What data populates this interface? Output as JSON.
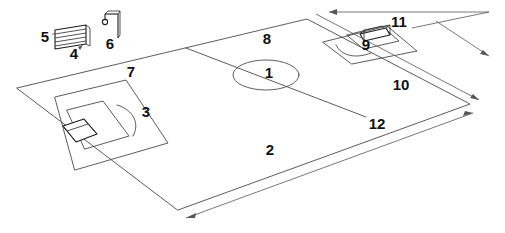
{
  "diagram": {
    "type": "technical-line-drawing",
    "background_color": "#ffffff",
    "line_color": "#4a4a4a",
    "label_color": "#111111",
    "callouts": [
      {
        "id": "1",
        "text": "1",
        "x": 269,
        "y": 74,
        "refers_to": "centre-circle"
      },
      {
        "id": "2",
        "text": "2",
        "x": 270,
        "y": 151,
        "refers_to": "near-touchline"
      },
      {
        "id": "3",
        "text": "3",
        "x": 146,
        "y": 113,
        "refers_to": "left-penalty-arc"
      },
      {
        "id": "4",
        "text": "4",
        "x": 74,
        "y": 55,
        "refers_to": "bench-seating"
      },
      {
        "id": "5",
        "text": "5",
        "x": 45,
        "y": 38,
        "refers_to": "bench-leader-line"
      },
      {
        "id": "6",
        "text": "6",
        "x": 110,
        "y": 45,
        "refers_to": "corner-flag-pole"
      },
      {
        "id": "7",
        "text": "7",
        "x": 131,
        "y": 73,
        "refers_to": "far-touchline"
      },
      {
        "id": "8",
        "text": "8",
        "x": 267,
        "y": 40,
        "refers_to": "far-half-surface"
      },
      {
        "id": "9",
        "text": "9",
        "x": 366,
        "y": 46,
        "refers_to": "right-penalty-arc"
      },
      {
        "id": "10",
        "text": "10",
        "x": 401,
        "y": 86,
        "refers_to": "right-goal-line"
      },
      {
        "id": "11",
        "text": "11",
        "x": 399,
        "y": 23,
        "refers_to": "right-goal"
      },
      {
        "id": "12",
        "text": "12",
        "x": 377,
        "y": 125,
        "refers_to": "halfway-line"
      }
    ],
    "objects": [
      {
        "name": "pitch-outline",
        "label": null
      },
      {
        "name": "halfway-line",
        "label": "12"
      },
      {
        "name": "centre-circle",
        "label": "1"
      },
      {
        "name": "left-penalty-area",
        "label": null
      },
      {
        "name": "left-goal-area",
        "label": null
      },
      {
        "name": "left-penalty-arc",
        "label": "3"
      },
      {
        "name": "left-goal",
        "label": null
      },
      {
        "name": "right-penalty-area",
        "label": null
      },
      {
        "name": "right-goal-area",
        "label": null
      },
      {
        "name": "right-penalty-arc",
        "label": "9"
      },
      {
        "name": "right-goal",
        "label": "11"
      },
      {
        "name": "team-bench",
        "label": "4"
      },
      {
        "name": "corner-flag-pole",
        "label": "6"
      },
      {
        "name": "dimension-near-touchline",
        "label": "2"
      },
      {
        "name": "dimension-right-goal-line",
        "label": "10"
      },
      {
        "name": "dimension-top-edge",
        "label": "11"
      }
    ]
  }
}
